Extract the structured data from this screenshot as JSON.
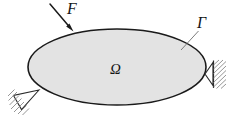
{
  "figure": {
    "background_color": "#ffffff",
    "width": 231,
    "height": 118
  },
  "labels": {
    "force": "F",
    "boundary": "Γ",
    "domain": "Ω"
  },
  "label_meanings": {
    "force": "applied force F",
    "boundary": "boundary Gamma",
    "domain": "domain Omega"
  },
  "colors": {
    "body_fill": "#e3e3e3",
    "body_stroke": "#1a1a1a",
    "arrow": "#1a1a1a",
    "leader_line": "#6e6e6e",
    "hatch": "#8a8a8a",
    "support_stroke": "#2a2a2a",
    "text": "#151515"
  },
  "geometry": {
    "body_shape": "ellipse",
    "body_center_x": 117,
    "body_center_y": 67,
    "body_radius_x": 89,
    "body_radius_y": 38,
    "body_stroke_width": 1.6,
    "force_arrow": {
      "x1": 50,
      "y1": 4,
      "x2": 73,
      "y2": 31,
      "head_length": 9,
      "head_width": 6
    },
    "boundary_leader": {
      "x1": 181,
      "y1": 50,
      "x2": 198,
      "y2": 31
    },
    "support_left": {
      "apex_x": 39,
      "apex_y": 90,
      "base_ax": 13,
      "base_ay": 96,
      "base_bx": 21,
      "base_by": 110,
      "hatch_count": 7
    },
    "support_right": {
      "apex_x": 205,
      "apex_y": 74,
      "base_ax": 213,
      "base_ay": 63,
      "base_bx": 213,
      "base_by": 86,
      "wall_x": 213,
      "wall_top": 61,
      "wall_bottom": 88,
      "hatch_count": 8
    }
  }
}
